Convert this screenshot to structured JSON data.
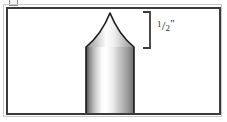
{
  "figure": {
    "name": "bullet-ogive-dimension-diagram",
    "type": "technical-line-illustration",
    "frame": {
      "border_color": "#3b3b3b",
      "outer_rule_color": "#c9c9c9",
      "background_color": "#ffffff",
      "x": 6,
      "y": 7,
      "width": 215,
      "height": 108
    },
    "artifact": {
      "name": "cropped-glyph-above-frame",
      "x": 9,
      "y": 0,
      "width": 7,
      "height": 5
    }
  },
  "bullet": {
    "label": "bullet",
    "outline_color": "#1a1a1a",
    "outline_width": 1.6,
    "apex": {
      "x": 110,
      "y": 13
    },
    "shoulder_left": {
      "x": 86,
      "y": 47
    },
    "shoulder_right": {
      "x": 134,
      "y": 47
    },
    "base_left": {
      "x": 86,
      "y": 114
    },
    "base_right": {
      "x": 134,
      "y": 114
    },
    "ogive_control_left": {
      "x": 97,
      "y": 38
    },
    "ogive_control_right": {
      "x": 123,
      "y": 38
    },
    "body_width": 48,
    "nose_height": 34,
    "total_height": 101,
    "gradient_stops": [
      {
        "offset": 0.0,
        "color": "#4a4a4a"
      },
      {
        "offset": 0.07,
        "color": "#888888"
      },
      {
        "offset": 0.18,
        "color": "#c6c6c6"
      },
      {
        "offset": 0.33,
        "color": "#fbfbfb"
      },
      {
        "offset": 0.42,
        "color": "#ffffff"
      },
      {
        "offset": 0.55,
        "color": "#ededed"
      },
      {
        "offset": 0.7,
        "color": "#c4c4c4"
      },
      {
        "offset": 0.86,
        "color": "#9d9d9d"
      },
      {
        "offset": 1.0,
        "color": "#6e6e6e"
      }
    ],
    "nose_gradient_stops": [
      {
        "offset": 0.0,
        "color": "#6f6f6f"
      },
      {
        "offset": 0.1,
        "color": "#a8a8a8"
      },
      {
        "offset": 0.28,
        "color": "#dcdcdc"
      },
      {
        "offset": 0.42,
        "color": "#fdfdfd"
      },
      {
        "offset": 0.58,
        "color": "#f0f0f0"
      },
      {
        "offset": 0.76,
        "color": "#c8c8c8"
      },
      {
        "offset": 1.0,
        "color": "#8c8c8c"
      }
    ]
  },
  "dimension": {
    "name": "ogive-length-dimension",
    "bracket": {
      "color": "#3b3b3b",
      "stroke_width": 1.8,
      "x_spine": 150,
      "x_tip": 143,
      "y_top": 12,
      "y_bottom": 48
    },
    "label_text": "1/2\"",
    "label_numerator": "1",
    "label_slash": "/",
    "label_denominator": "2",
    "label_inch_mark": "\"",
    "label_color": "#2a2a2a",
    "label_position": {
      "x": 157,
      "y": 18
    },
    "measures": "nose / ogive length"
  },
  "colors": {
    "frame_border": "#3b3b3b",
    "outer_rule": "#c9c9c9",
    "outline": "#1a1a1a",
    "label": "#2a2a2a",
    "background": "#ffffff"
  }
}
